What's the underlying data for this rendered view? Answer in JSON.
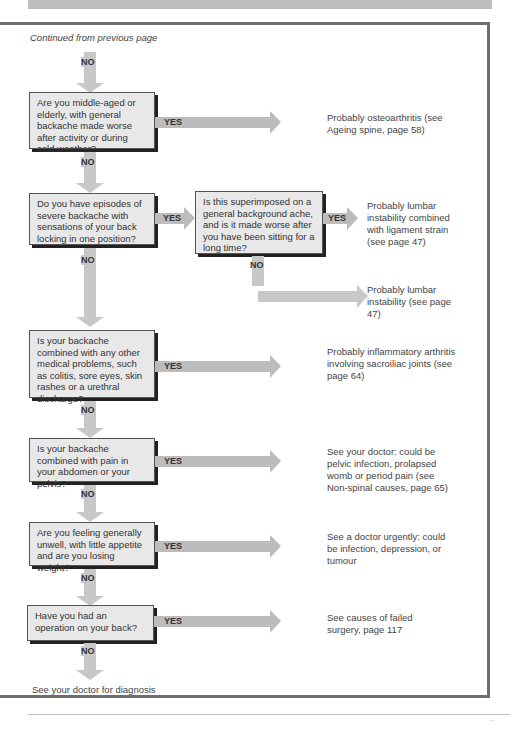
{
  "header": {
    "continued": "Continued from previous page"
  },
  "labels": {
    "yes": "YES",
    "no": "NO"
  },
  "questions": [
    {
      "text": "Are you middle-aged or elderly, with general backache made worse after activity or during cold weather?"
    },
    {
      "text": "Do you have episodes of severe backache with sensations of your back locking in one position?"
    },
    {
      "text": "Is this superimposed on a general background ache, and is it made worse after you have been sitting for a long time?"
    },
    {
      "text": "Is your backache combined with any other medical problems, such as colitis, sore eyes, skin rashes or a urethral discharge?"
    },
    {
      "text": "Is your backache combined with pain in your abdomen or your pelvis?"
    },
    {
      "text": "Are you feeling generally unwell, with little appetite and are you losing weight?"
    },
    {
      "text": "Have you had an operation on your back?"
    }
  ],
  "results": [
    {
      "text": "Probably osteoarthritis (see Ageing spine, page 58)"
    },
    {
      "text": "Probably lumbar instability combined with ligament strain (see page 47)"
    },
    {
      "text": "Probably lumbar instability (see page 47)"
    },
    {
      "text": "Probably inflammatory arthritis involving sacroiliac joints (see page 64)"
    },
    {
      "text": "See your doctor: could be pelvic infection, prolapsed womb or period pain (see Non-spinal causes, page 65)"
    },
    {
      "text": "See a doctor urgently: could be infection, depression, or tumour"
    },
    {
      "text": "See causes of failed surgery, page 117"
    }
  ],
  "final": {
    "text": "See your doctor for diagnosis"
  },
  "footer": {
    "page_number": "··"
  },
  "colors": {
    "box_fill": "#e8e8e8",
    "arrow": "#c8c8c8",
    "frame": "#6e6e6e"
  }
}
